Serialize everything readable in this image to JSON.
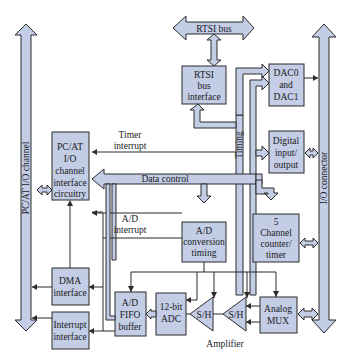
{
  "colors": {
    "block_fill": "#c3cde6",
    "stroke": "#2b2b2b",
    "background": "#ffffff"
  },
  "buses": {
    "pc_at": "PC/AT I/O channel",
    "io_connector": "I/O connector",
    "rtsi": "RTSI bus",
    "data_control": "Data control",
    "timing": "Timing"
  },
  "blocks": {
    "rtsi_interface": [
      "RTSI",
      "bus",
      "interface"
    ],
    "dac": [
      "DAC0",
      "and",
      "DAC1"
    ],
    "digital_io": [
      "Digital",
      "input/",
      "output"
    ],
    "pcat_interface": [
      "PC/AT",
      "I/O",
      "channel",
      "interface",
      "circuitry"
    ],
    "ad_timing": [
      "A/D",
      "conversion",
      "timing"
    ],
    "counter": [
      "5",
      "Channel",
      "counter/",
      "timer"
    ],
    "dma": [
      "DMA",
      "interface"
    ],
    "interrupt": [
      "Interrupt",
      "interface"
    ],
    "fifo": [
      "A/D",
      "FIFO",
      "buffer"
    ],
    "adc": [
      "12-bit",
      "ADC"
    ],
    "sh1": "S/H",
    "sh2": "S/H",
    "mux": [
      "Analog",
      "MUX"
    ]
  },
  "labels": {
    "timer_interrupt": [
      "Timer",
      "interrupt"
    ],
    "ad_interrupt": [
      "A/D",
      "interrupt"
    ],
    "amplifier": "Amplifier"
  }
}
